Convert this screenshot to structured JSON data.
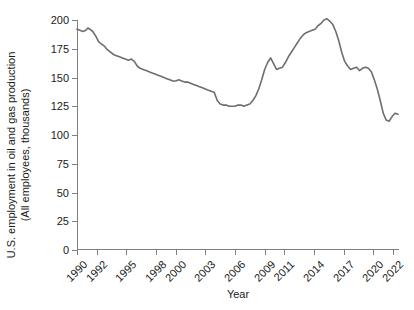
{
  "chart_data": {
    "type": "line",
    "title": "",
    "xlabel": "Year",
    "ylabel_line1": "U.S. employment in oil and gas production",
    "ylabel_line2": "(All employees, thousands)",
    "ylim": [
      0,
      200
    ],
    "yticks": [
      0,
      25,
      50,
      75,
      100,
      125,
      150,
      175,
      200
    ],
    "ytick_labels": [
      "0",
      "25",
      "50",
      "75",
      "100",
      "125",
      "150",
      "175",
      "200"
    ],
    "xlim": [
      1990,
      2022.6
    ],
    "xticks": [
      1990,
      1992,
      1995,
      1998,
      2000,
      2003,
      2006,
      2009,
      2011,
      2014,
      2017,
      2020,
      2022
    ],
    "xtick_labels": [
      "1990",
      "1992",
      "1995",
      "1998",
      "2000",
      "2003",
      "2006",
      "2009",
      "2011",
      "2014",
      "2017",
      "2020",
      "2022"
    ],
    "grid": false,
    "legend": false,
    "line_color": "#6e6e6e",
    "axis_color": "#808080",
    "series": [
      {
        "name": "U.S. employment in oil and gas production",
        "x": [
          1990.0,
          1990.3,
          1990.6,
          1990.9,
          1991.1,
          1991.3,
          1991.6,
          1991.9,
          1992.2,
          1992.5,
          1992.8,
          1993.1,
          1993.4,
          1993.7,
          1994.0,
          1994.3,
          1994.6,
          1994.9,
          1995.2,
          1995.5,
          1995.8,
          1996.1,
          1996.4,
          1996.7,
          1997.0,
          1997.3,
          1997.6,
          1997.9,
          1998.2,
          1998.5,
          1998.8,
          1999.1,
          1999.4,
          1999.7,
          2000.0,
          2000.3,
          2000.6,
          2000.9,
          2001.2,
          2001.5,
          2001.8,
          2002.1,
          2002.4,
          2002.7,
          2003.0,
          2003.3,
          2003.6,
          2003.9,
          2004.2,
          2004.5,
          2004.8,
          2005.1,
          2005.4,
          2005.7,
          2006.0,
          2006.3,
          2006.6,
          2006.9,
          2007.2,
          2007.5,
          2007.8,
          2008.1,
          2008.4,
          2008.7,
          2009.0,
          2009.3,
          2009.6,
          2009.9,
          2010.2,
          2010.5,
          2010.8,
          2011.1,
          2011.4,
          2011.7,
          2012.0,
          2012.3,
          2012.6,
          2012.9,
          2013.2,
          2013.5,
          2013.8,
          2014.1,
          2014.4,
          2014.7,
          2015.0,
          2015.3,
          2015.6,
          2015.9,
          2016.2,
          2016.5,
          2016.8,
          2017.1,
          2017.4,
          2017.7,
          2018.0,
          2018.3,
          2018.6,
          2018.9,
          2019.2,
          2019.5,
          2019.8,
          2020.1,
          2020.4,
          2020.7,
          2021.0,
          2021.3,
          2021.6,
          2021.9,
          2022.2,
          2022.5
        ],
        "y": [
          192,
          191,
          190,
          191,
          193,
          192,
          190,
          186,
          181,
          179,
          177,
          174,
          172,
          170,
          169,
          168,
          167,
          166,
          165,
          166,
          164,
          160,
          158,
          157,
          156,
          155,
          154,
          153,
          152,
          151,
          150,
          149,
          148,
          147,
          147,
          148,
          147,
          146,
          146,
          145,
          144,
          143,
          142,
          141,
          140,
          139,
          138,
          137,
          130,
          127,
          126,
          126,
          125,
          125,
          125,
          126,
          126,
          125,
          126,
          127,
          130,
          134,
          140,
          148,
          157,
          163,
          167,
          162,
          157,
          158,
          159,
          163,
          168,
          172,
          176,
          180,
          184,
          187,
          189,
          190,
          191,
          192,
          195,
          197,
          200,
          201,
          199,
          196,
          190,
          182,
          172,
          164,
          160,
          157,
          158,
          159,
          156,
          158,
          159,
          158,
          155,
          148,
          140,
          130,
          119,
          113,
          112,
          116,
          119,
          118
        ]
      }
    ]
  }
}
